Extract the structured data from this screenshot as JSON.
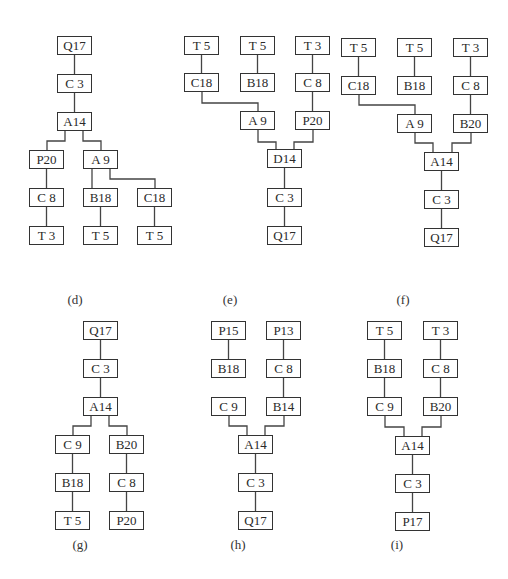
{
  "figure": {
    "stroke_color": "#333333",
    "background": "#ffffff"
  },
  "panels": [
    {
      "id": "d",
      "caption": "(d)",
      "caption_pos": [
        75,
        300
      ],
      "nodes": [
        {
          "id": "d1",
          "label": "Q17",
          "x": 57,
          "y": 36
        },
        {
          "id": "d2",
          "label": "C 3",
          "x": 57,
          "y": 74
        },
        {
          "id": "d3",
          "label": "A14",
          "x": 57,
          "y": 112
        },
        {
          "id": "d4",
          "label": "P20",
          "x": 29,
          "y": 150
        },
        {
          "id": "d5",
          "label": "A 9",
          "x": 83,
          "y": 150
        },
        {
          "id": "d6",
          "label": "C 8",
          "x": 29,
          "y": 188
        },
        {
          "id": "d7",
          "label": "B18",
          "x": 83,
          "y": 188
        },
        {
          "id": "d8",
          "label": "C18",
          "x": 137,
          "y": 188
        },
        {
          "id": "d9",
          "label": "T 3",
          "x": 29,
          "y": 226
        },
        {
          "id": "d10",
          "label": "T 5",
          "x": 83,
          "y": 226
        },
        {
          "id": "d11",
          "label": "T 5",
          "x": 137,
          "y": 226
        }
      ],
      "edges": [
        {
          "type": "v",
          "from": "d1",
          "to": "d2"
        },
        {
          "type": "v",
          "from": "d2",
          "to": "d3"
        },
        {
          "type": "elbow",
          "points": [
            [
              65,
              131
            ],
            [
              65,
              141
            ],
            [
              47,
              141
            ],
            [
              47,
              150
            ]
          ]
        },
        {
          "type": "elbow",
          "points": [
            [
              83,
              131
            ],
            [
              83,
              141
            ],
            [
              101,
              141
            ],
            [
              101,
              150
            ]
          ]
        },
        {
          "type": "v",
          "from": "d4",
          "to": "d6"
        },
        {
          "type": "v",
          "from": "d6",
          "to": "d9"
        },
        {
          "type": "elbow",
          "points": [
            [
              92,
              169
            ],
            [
              92,
              188
            ]
          ]
        },
        {
          "type": "elbow",
          "points": [
            [
              110,
              169
            ],
            [
              110,
              179
            ],
            [
              155,
              179
            ],
            [
              155,
              188
            ]
          ]
        },
        {
          "type": "v",
          "from": "d7",
          "to": "d10"
        },
        {
          "type": "v",
          "from": "d8",
          "to": "d11"
        }
      ]
    },
    {
      "id": "e",
      "caption": "(e)",
      "caption_pos": [
        230,
        300
      ],
      "nodes": [
        {
          "id": "e1",
          "label": "T 5",
          "x": 184,
          "y": 36
        },
        {
          "id": "e2",
          "label": "T 5",
          "x": 240,
          "y": 36
        },
        {
          "id": "e3",
          "label": "T 3",
          "x": 295,
          "y": 36
        },
        {
          "id": "e4",
          "label": "C18",
          "x": 184,
          "y": 73
        },
        {
          "id": "e5",
          "label": "B18",
          "x": 240,
          "y": 73
        },
        {
          "id": "e6",
          "label": "C 8",
          "x": 295,
          "y": 73
        },
        {
          "id": "e7",
          "label": "A 9",
          "x": 240,
          "y": 111
        },
        {
          "id": "e8",
          "label": "P20",
          "x": 295,
          "y": 111
        },
        {
          "id": "e9",
          "label": "D14",
          "x": 267,
          "y": 149
        },
        {
          "id": "e10",
          "label": "C 3",
          "x": 267,
          "y": 188
        },
        {
          "id": "e11",
          "label": "Q17",
          "x": 267,
          "y": 226
        }
      ],
      "edges": [
        {
          "type": "v",
          "from": "e1",
          "to": "e4"
        },
        {
          "type": "v",
          "from": "e2",
          "to": "e5"
        },
        {
          "type": "v",
          "from": "e3",
          "to": "e6"
        },
        {
          "type": "elbow",
          "points": [
            [
              202,
              92
            ],
            [
              202,
              103
            ],
            [
              258,
              103
            ],
            [
              258,
              111
            ]
          ]
        },
        {
          "type": "v",
          "from": "e6",
          "to": "e8"
        },
        {
          "type": "elbow",
          "points": [
            [
              258,
              130
            ],
            [
              258,
              142
            ],
            [
              276,
              142
            ],
            [
              276,
              149
            ]
          ]
        },
        {
          "type": "elbow",
          "points": [
            [
              313,
              130
            ],
            [
              313,
              142
            ],
            [
              294,
              142
            ],
            [
              294,
              149
            ]
          ]
        },
        {
          "type": "v",
          "from": "e9",
          "to": "e10"
        },
        {
          "type": "v",
          "from": "e10",
          "to": "e11"
        }
      ]
    },
    {
      "id": "f",
      "caption": "(f)",
      "caption_pos": [
        403,
        300
      ],
      "nodes": [
        {
          "id": "f1",
          "label": "T 5",
          "x": 341,
          "y": 38
        },
        {
          "id": "f2",
          "label": "T 5",
          "x": 397,
          "y": 38
        },
        {
          "id": "f3",
          "label": "T 3",
          "x": 453,
          "y": 38
        },
        {
          "id": "f4",
          "label": "C18",
          "x": 341,
          "y": 76
        },
        {
          "id": "f5",
          "label": "B18",
          "x": 397,
          "y": 76
        },
        {
          "id": "f6",
          "label": "C 8",
          "x": 453,
          "y": 76
        },
        {
          "id": "f7",
          "label": "A 9",
          "x": 397,
          "y": 114
        },
        {
          "id": "f8",
          "label": "B20",
          "x": 453,
          "y": 114
        },
        {
          "id": "f9",
          "label": "A14",
          "x": 424,
          "y": 152
        },
        {
          "id": "f10",
          "label": "C 3",
          "x": 424,
          "y": 190
        },
        {
          "id": "f11",
          "label": "Q17",
          "x": 424,
          "y": 228
        }
      ],
      "edges": [
        {
          "type": "v",
          "from": "f1",
          "to": "f4"
        },
        {
          "type": "v",
          "from": "f2",
          "to": "f5"
        },
        {
          "type": "v",
          "from": "f3",
          "to": "f6"
        },
        {
          "type": "elbow",
          "points": [
            [
              359,
              95
            ],
            [
              359,
              105
            ],
            [
              415,
              105
            ],
            [
              415,
              114
            ]
          ]
        },
        {
          "type": "v",
          "from": "f6",
          "to": "f8"
        },
        {
          "type": "elbow",
          "points": [
            [
              415,
              133
            ],
            [
              415,
              143
            ],
            [
              433,
              143
            ],
            [
              433,
              152
            ]
          ]
        },
        {
          "type": "elbow",
          "points": [
            [
              471,
              133
            ],
            [
              471,
              143
            ],
            [
              452,
              143
            ],
            [
              452,
              152
            ]
          ]
        },
        {
          "type": "v",
          "from": "f9",
          "to": "f10"
        },
        {
          "type": "v",
          "from": "f10",
          "to": "f11"
        }
      ]
    },
    {
      "id": "g",
      "caption": "(g)",
      "caption_pos": [
        80,
        545
      ],
      "nodes": [
        {
          "id": "g1",
          "label": "Q17",
          "x": 83,
          "y": 321
        },
        {
          "id": "g2",
          "label": "C 3",
          "x": 83,
          "y": 359
        },
        {
          "id": "g3",
          "label": "A14",
          "x": 83,
          "y": 397
        },
        {
          "id": "g4",
          "label": "C 9",
          "x": 55,
          "y": 435
        },
        {
          "id": "g5",
          "label": "B20",
          "x": 109,
          "y": 435
        },
        {
          "id": "g6",
          "label": "B18",
          "x": 55,
          "y": 473
        },
        {
          "id": "g7",
          "label": "C 8",
          "x": 109,
          "y": 473
        },
        {
          "id": "g8",
          "label": "T 5",
          "x": 55,
          "y": 511
        },
        {
          "id": "g9",
          "label": "P20",
          "x": 109,
          "y": 511
        }
      ],
      "edges": [
        {
          "type": "v",
          "from": "g1",
          "to": "g2"
        },
        {
          "type": "v",
          "from": "g2",
          "to": "g3"
        },
        {
          "type": "elbow",
          "points": [
            [
              91,
              416
            ],
            [
              91,
              426
            ],
            [
              73,
              426
            ],
            [
              73,
              435
            ]
          ]
        },
        {
          "type": "elbow",
          "points": [
            [
              109,
              416
            ],
            [
              109,
              426
            ],
            [
              127,
              426
            ],
            [
              127,
              435
            ]
          ]
        },
        {
          "type": "v",
          "from": "g4",
          "to": "g6"
        },
        {
          "type": "v",
          "from": "g6",
          "to": "g8"
        },
        {
          "type": "v",
          "from": "g5",
          "to": "g7"
        },
        {
          "type": "v",
          "from": "g7",
          "to": "g9"
        }
      ]
    },
    {
      "id": "h",
      "caption": "(h)",
      "caption_pos": [
        238,
        545
      ],
      "nodes": [
        {
          "id": "h1",
          "label": "P15",
          "x": 211,
          "y": 321
        },
        {
          "id": "h2",
          "label": "P13",
          "x": 266,
          "y": 321
        },
        {
          "id": "h3",
          "label": "B18",
          "x": 211,
          "y": 359
        },
        {
          "id": "h4",
          "label": "C 8",
          "x": 266,
          "y": 359
        },
        {
          "id": "h5",
          "label": "C 9",
          "x": 211,
          "y": 397
        },
        {
          "id": "h6",
          "label": "B14",
          "x": 266,
          "y": 397
        },
        {
          "id": "h7",
          "label": "A14",
          "x": 238,
          "y": 435
        },
        {
          "id": "h8",
          "label": "C 3",
          "x": 238,
          "y": 473
        },
        {
          "id": "h9",
          "label": "Q17",
          "x": 238,
          "y": 511
        }
      ],
      "edges": [
        {
          "type": "v",
          "from": "h1",
          "to": "h3"
        },
        {
          "type": "v",
          "from": "h2",
          "to": "h4"
        },
        {
          "type": "v",
          "from": "h4",
          "to": "h6"
        },
        {
          "type": "elbow",
          "points": [
            [
              229,
              416
            ],
            [
              229,
              426
            ],
            [
              247,
              426
            ],
            [
              247,
              435
            ]
          ]
        },
        {
          "type": "elbow",
          "points": [
            [
              284,
              416
            ],
            [
              284,
              426
            ],
            [
              265,
              426
            ],
            [
              265,
              435
            ]
          ]
        },
        {
          "type": "v",
          "from": "h7",
          "to": "h8"
        },
        {
          "type": "v",
          "from": "h8",
          "to": "h9"
        }
      ]
    },
    {
      "id": "i",
      "caption": "(i)",
      "caption_pos": [
        397,
        545
      ],
      "nodes": [
        {
          "id": "i1",
          "label": "T 5",
          "x": 367,
          "y": 321
        },
        {
          "id": "i2",
          "label": "T 3",
          "x": 423,
          "y": 321
        },
        {
          "id": "i3",
          "label": "B18",
          "x": 367,
          "y": 359
        },
        {
          "id": "i4",
          "label": "C 8",
          "x": 423,
          "y": 359
        },
        {
          "id": "i5",
          "label": "C 9",
          "x": 367,
          "y": 397
        },
        {
          "id": "i6",
          "label": "B20",
          "x": 423,
          "y": 397
        },
        {
          "id": "i7",
          "label": "A14",
          "x": 395,
          "y": 436
        },
        {
          "id": "i8",
          "label": "C 3",
          "x": 395,
          "y": 474
        },
        {
          "id": "i9",
          "label": "P17",
          "x": 395,
          "y": 512
        }
      ],
      "edges": [
        {
          "type": "v",
          "from": "i1",
          "to": "i3"
        },
        {
          "type": "v",
          "from": "i3",
          "to": "i5"
        },
        {
          "type": "v",
          "from": "i2",
          "to": "i4"
        },
        {
          "type": "v",
          "from": "i4",
          "to": "i6"
        },
        {
          "type": "elbow",
          "points": [
            [
              385,
              416
            ],
            [
              385,
              427
            ],
            [
              404,
              427
            ],
            [
              404,
              436
            ]
          ]
        },
        {
          "type": "elbow",
          "points": [
            [
              441,
              416
            ],
            [
              441,
              427
            ],
            [
              422,
              427
            ],
            [
              422,
              436
            ]
          ]
        },
        {
          "type": "v",
          "from": "i7",
          "to": "i8"
        },
        {
          "type": "v",
          "from": "i8",
          "to": "i9"
        }
      ]
    }
  ]
}
